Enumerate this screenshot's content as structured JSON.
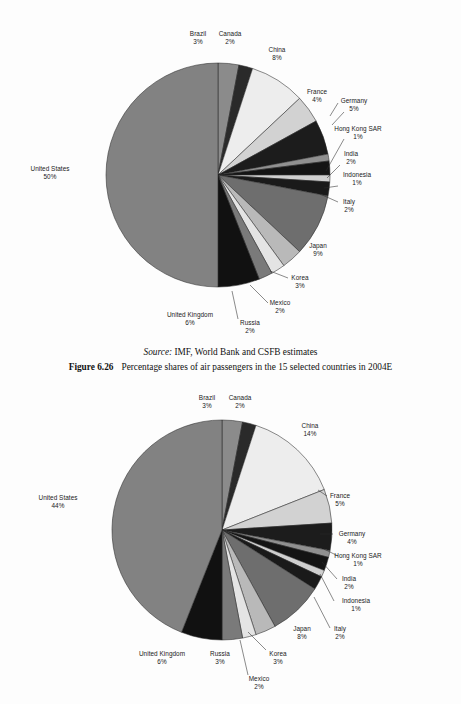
{
  "caption": {
    "source_prefix": "Source:",
    "source_text": " IMF, World Bank and CSFB estimates",
    "figure_number": "Figure 6.26",
    "figure_title": "Percentage shares of air passengers in the 15 selected countries in 2004E"
  },
  "chart_data": [
    {
      "type": "pie",
      "id": "air-passengers-2004e-upper",
      "title": "",
      "legend": "labels-on-slices",
      "start_angle_deg": 0,
      "direction": "clockwise",
      "categories": [
        "Brazil",
        "Canada",
        "China",
        "France",
        "Germany",
        "Hong Kong SAR",
        "India",
        "Indonesia",
        "Italy",
        "Japan",
        "Korea",
        "Mexico",
        "Russia",
        "United Kingdom",
        "United States"
      ],
      "values": [
        3,
        2,
        8,
        4,
        5,
        1,
        2,
        1,
        2,
        9,
        3,
        2,
        2,
        6,
        50
      ],
      "value_labels": [
        "3%",
        "2%",
        "8%",
        "4%",
        "5%",
        "1%",
        "2%",
        "1%",
        "2%",
        "9%",
        "3%",
        "2%",
        "2%",
        "6%",
        "50%"
      ],
      "colors": [
        "#8b8b8b",
        "#2a2a2a",
        "#ededed",
        "#d2d2d2",
        "#1c1c1c",
        "#909090",
        "#141414",
        "#cfcfcf",
        "#1a1a1a",
        "#6e6e6e",
        "#b9b9b9",
        "#e4e4e4",
        "#7a7a7a",
        "#111111",
        "#828282"
      ],
      "labels": [
        {
          "name": "Brazil",
          "pct": "3%",
          "align": "center",
          "x": 198,
          "y": 22,
          "leader": null
        },
        {
          "name": "Canada",
          "pct": "2%",
          "align": "center",
          "x": 230,
          "y": 22,
          "leader": null
        },
        {
          "name": "China",
          "pct": "8%",
          "align": "center",
          "x": 277,
          "y": 38,
          "leader": null
        },
        {
          "name": "France",
          "pct": "4%",
          "align": "center",
          "x": 317,
          "y": 80,
          "leader": {
            "x1": 338,
            "y1": 95,
            "x2": 330,
            "y2": 108
          }
        },
        {
          "name": "Germany",
          "pct": "5%",
          "align": "center",
          "x": 354,
          "y": 89,
          "leader": {
            "x1": 344,
            "y1": 104,
            "x2": 332,
            "y2": 117
          }
        },
        {
          "name": "Hong Kong SAR",
          "pct": "1%",
          "align": "center",
          "x": 358,
          "y": 117,
          "leader": {
            "x1": 344,
            "y1": 131,
            "x2": 326,
            "y2": 163
          }
        },
        {
          "name": "India",
          "pct": "2%",
          "align": "center",
          "x": 351,
          "y": 142,
          "leader": {
            "x1": 340,
            "y1": 157,
            "x2": 327,
            "y2": 170
          }
        },
        {
          "name": "Indonesia",
          "pct": "1%",
          "align": "center",
          "x": 357,
          "y": 163,
          "leader": {
            "x1": 338,
            "y1": 178,
            "x2": 324,
            "y2": 180
          }
        },
        {
          "name": "Italy",
          "pct": "2%",
          "align": "center",
          "x": 349,
          "y": 190,
          "leader": {
            "x1": 338,
            "y1": 194,
            "x2": 320,
            "y2": 186
          }
        },
        {
          "name": "Japan",
          "pct": "9%",
          "align": "center",
          "x": 318,
          "y": 234,
          "leader": null
        },
        {
          "name": "Korea",
          "pct": "3%",
          "align": "center",
          "x": 300,
          "y": 266,
          "leader": {
            "x1": 288,
            "y1": 270,
            "x2": 270,
            "y2": 263
          }
        },
        {
          "name": "Mexico",
          "pct": "2%",
          "align": "center",
          "x": 280,
          "y": 291,
          "leader": {
            "x1": 268,
            "y1": 295,
            "x2": 250,
            "y2": 277
          }
        },
        {
          "name": "Russia",
          "pct": "2%",
          "align": "center",
          "x": 250,
          "y": 311,
          "leader": {
            "x1": 238,
            "y1": 311,
            "x2": 232,
            "y2": 283
          }
        },
        {
          "name": "United Kingdom",
          "pct": "6%",
          "align": "center",
          "x": 190,
          "y": 303,
          "leader": null
        },
        {
          "name": "United States",
          "pct": "50%",
          "align": "center",
          "x": 50,
          "y": 157,
          "leader": null
        }
      ]
    },
    {
      "type": "pie",
      "id": "air-passengers-lower",
      "title": "",
      "legend": "labels-on-slices",
      "start_angle_deg": 0,
      "direction": "clockwise",
      "categories": [
        "Brazil",
        "Canada",
        "China",
        "France",
        "Germany",
        "Hong Kong SAR",
        "India",
        "Indonesia",
        "Italy",
        "Japan",
        "Korea",
        "Mexico",
        "Russia",
        "United Kingdom",
        "United States"
      ],
      "values": [
        3,
        2,
        14,
        5,
        4,
        1,
        2,
        1,
        2,
        8,
        3,
        2,
        3,
        6,
        44
      ],
      "value_labels": [
        "3%",
        "2%",
        "14%",
        "5%",
        "4%",
        "1%",
        "2%",
        "1%",
        "2%",
        "8%",
        "3%",
        "2%",
        "3%",
        "6%",
        "44%"
      ],
      "colors": [
        "#8b8b8b",
        "#2a2a2a",
        "#ededed",
        "#d2d2d2",
        "#1c1c1c",
        "#909090",
        "#141414",
        "#cfcfcf",
        "#1a1a1a",
        "#6e6e6e",
        "#b9b9b9",
        "#e4e4e4",
        "#7a7a7a",
        "#111111",
        "#828282"
      ],
      "labels": [
        {
          "name": "Brazil",
          "pct": "3%",
          "align": "center",
          "x": 207,
          "y": 12,
          "leader": null
        },
        {
          "name": "Canada",
          "pct": "2%",
          "align": "center",
          "x": 240,
          "y": 12,
          "leader": null
        },
        {
          "name": "China",
          "pct": "14%",
          "align": "center",
          "x": 310,
          "y": 40,
          "leader": null
        },
        {
          "name": "France",
          "pct": "5%",
          "align": "center",
          "x": 340,
          "y": 110,
          "leader": {
            "x1": 327,
            "y1": 114,
            "x2": 318,
            "y2": 108
          }
        },
        {
          "name": "Germany",
          "pct": "4%",
          "align": "center",
          "x": 352,
          "y": 148,
          "leader": {
            "x1": 333,
            "y1": 152,
            "x2": 320,
            "y2": 152
          }
        },
        {
          "name": "Hong Kong SAR",
          "pct": "1%",
          "align": "center",
          "x": 358,
          "y": 170,
          "leader": {
            "x1": 338,
            "y1": 174,
            "x2": 324,
            "y2": 167
          }
        },
        {
          "name": "India",
          "pct": "2%",
          "align": "center",
          "x": 349,
          "y": 193,
          "leader": {
            "x1": 337,
            "y1": 197,
            "x2": 322,
            "y2": 180
          }
        },
        {
          "name": "Indonesia",
          "pct": "1%",
          "align": "center",
          "x": 356,
          "y": 215,
          "leader": {
            "x1": 334,
            "y1": 219,
            "x2": 320,
            "y2": 192
          }
        },
        {
          "name": "Italy",
          "pct": "2%",
          "align": "center",
          "x": 340,
          "y": 243,
          "leader": {
            "x1": 330,
            "y1": 246,
            "x2": 314,
            "y2": 215
          }
        },
        {
          "name": "Japan",
          "pct": "8%",
          "align": "center",
          "x": 302,
          "y": 243,
          "leader": null
        },
        {
          "name": "Korea",
          "pct": "3%",
          "align": "center",
          "x": 278,
          "y": 268,
          "leader": {
            "x1": 266,
            "y1": 268,
            "x2": 248,
            "y2": 250
          }
        },
        {
          "name": "Mexico",
          "pct": "2%",
          "align": "center",
          "x": 259,
          "y": 293,
          "leader": {
            "x1": 248,
            "y1": 293,
            "x2": 240,
            "y2": 258
          }
        },
        {
          "name": "Russia",
          "pct": "3%",
          "align": "center",
          "x": 220,
          "y": 268,
          "leader": null
        },
        {
          "name": "United Kingdom",
          "pct": "6%",
          "align": "center",
          "x": 162,
          "y": 268,
          "leader": null
        },
        {
          "name": "United States",
          "pct": "44%",
          "align": "center",
          "x": 58,
          "y": 112,
          "leader": null
        }
      ]
    }
  ]
}
